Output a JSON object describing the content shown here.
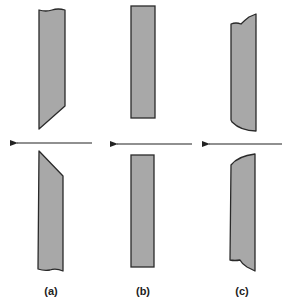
{
  "figure": {
    "colors": {
      "fill": "#a8a8a8",
      "stroke": "#2a2a2a",
      "arrow": "#222222",
      "background": "#ffffff"
    },
    "panels": [
      {
        "id": "a",
        "label": "(a)",
        "shape": "angled-cut",
        "arrow_direction": "left"
      },
      {
        "id": "b",
        "label": "(b)",
        "shape": "straight-cut",
        "arrow_direction": "left"
      },
      {
        "id": "c",
        "label": "(c)",
        "shape": "curved-cut",
        "arrow_direction": "left"
      }
    ]
  }
}
